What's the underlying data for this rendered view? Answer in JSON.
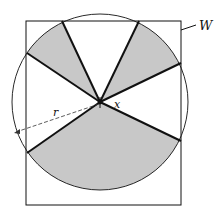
{
  "diagram": {
    "labels": {
      "window": "W",
      "radius": "r",
      "point": "x"
    },
    "colors": {
      "shade": "#c8c8c8",
      "line": "#111111",
      "background": "#ffffff"
    },
    "shaded_sectors": 3,
    "rays": 6
  }
}
